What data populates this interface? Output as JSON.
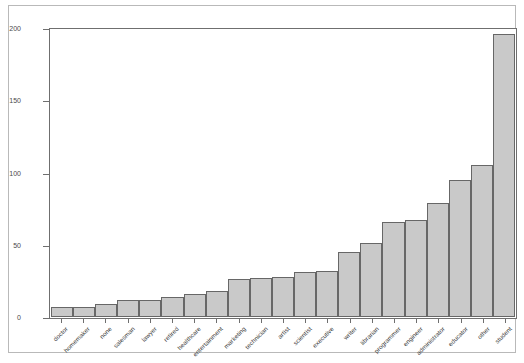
{
  "chart_data": {
    "type": "bar",
    "title": "",
    "xlabel": "",
    "ylabel": "",
    "categories": [
      "doctor",
      "homemaker",
      "none",
      "salesman",
      "lawyer",
      "retired",
      "healthcare",
      "entertainment",
      "marketing",
      "technician",
      "artist",
      "scientist",
      "executive",
      "writer",
      "librarian",
      "programmer",
      "engineer",
      "administrator",
      "educator",
      "other",
      "student"
    ],
    "values": [
      7,
      7,
      9,
      12,
      12,
      14,
      16,
      18,
      26,
      27,
      28,
      31,
      32,
      45,
      51,
      66,
      67,
      79,
      95,
      105,
      196
    ],
    "ylim": [
      0,
      200
    ],
    "yticks": [
      0,
      50,
      100,
      150,
      200
    ],
    "ytick_labels": [
      "0",
      "50",
      "100",
      "150",
      "200"
    ],
    "grid": false,
    "legend": false,
    "bar_fill_color": "#c9c9c9",
    "bar_edge_color": "#676767",
    "axes_color": "#6f6f6f",
    "background_color": "#ffffff"
  }
}
